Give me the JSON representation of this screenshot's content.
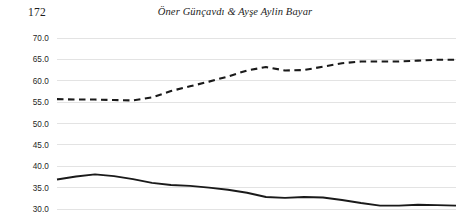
{
  "page": {
    "folio": "172",
    "running_title": "Öner Günçavdı & Ayşe Aylin Bayar"
  },
  "chart_data": {
    "type": "line",
    "title": "",
    "subtitle": "",
    "xlabel": "",
    "ylabel": "",
    "grid": true,
    "legend": "none",
    "ylim": [
      30.0,
      70.0
    ],
    "yticks": [
      "30.0",
      "35.0",
      "40.0",
      "45.0",
      "50.0",
      "55.0",
      "60.0",
      "65.0",
      "70.0"
    ],
    "ytick_values": [
      30.0,
      35.0,
      40.0,
      45.0,
      50.0,
      55.0,
      60.0,
      65.0,
      70.0
    ],
    "xlim": [
      0,
      21
    ],
    "xticks": [],
    "xtick_labels": [],
    "series": [
      {
        "name": "dashed-series",
        "style": "dashed",
        "color": "#1a1a1a",
        "x": [
          0,
          1,
          2,
          3,
          4,
          5,
          6,
          7,
          8,
          9,
          10,
          11,
          12,
          13,
          14,
          15,
          16,
          17,
          18,
          19,
          20,
          21
        ],
        "values": [
          55.7,
          55.6,
          55.6,
          55.5,
          55.4,
          56.1,
          57.6,
          58.7,
          59.8,
          61.0,
          62.4,
          63.2,
          62.4,
          62.5,
          63.3,
          64.1,
          64.5,
          64.5,
          64.5,
          64.7,
          64.9,
          64.9
        ]
      },
      {
        "name": "solid-series",
        "style": "solid",
        "color": "#1a1a1a",
        "x": [
          0,
          1,
          2,
          3,
          4,
          5,
          6,
          7,
          8,
          9,
          10,
          11,
          12,
          13,
          14,
          15,
          16,
          17,
          18,
          19,
          20,
          21
        ],
        "values": [
          36.9,
          37.6,
          38.1,
          37.7,
          37.0,
          36.1,
          35.6,
          35.4,
          35.0,
          34.5,
          33.8,
          32.8,
          32.6,
          32.8,
          32.7,
          32.1,
          31.4,
          30.8,
          30.8,
          31.0,
          30.9,
          30.8
        ]
      }
    ]
  }
}
